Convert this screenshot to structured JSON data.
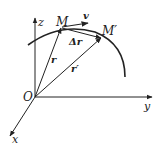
{
  "diagram": {
    "colors": {
      "stroke": "#222222",
      "background": "#ffffff"
    },
    "axes": {
      "origin_label": "O",
      "z_label": "z",
      "y_label": "y",
      "x_label": "x"
    },
    "points": {
      "M_label": "M",
      "M_prime_label": "M′"
    },
    "vectors": {
      "velocity_label": "v",
      "delta_r_label": "Δr",
      "r_label": "r",
      "r_prime_label": "r′"
    }
  }
}
